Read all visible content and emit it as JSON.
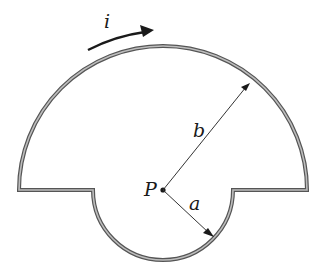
{
  "diagram": {
    "labels": {
      "current": "i",
      "point": "P",
      "outer_radius": "b",
      "inner_radius": "a"
    },
    "geometry": {
      "center": [
        163,
        190
      ],
      "outer_radius_px": 144,
      "inner_radius_px": 70
    },
    "colors": {
      "wire": "#8c8c8c",
      "wire_edge": "#555555",
      "ink": "#1a1a1a"
    }
  }
}
